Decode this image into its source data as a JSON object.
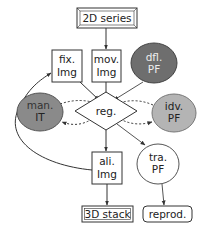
{
  "nodes": {
    "series2d": {
      "label": "2D series",
      "shape": "snip-box"
    },
    "fix_img": {
      "lines": [
        "fix.",
        "Img"
      ],
      "shape": "box"
    },
    "mov_img": {
      "lines": [
        "mov.",
        "Img"
      ],
      "shape": "box"
    },
    "dfl_pf": {
      "lines": [
        "dfl.",
        "PF"
      ],
      "shape": "ellipse",
      "fill": "#6e6e6e"
    },
    "man_it": {
      "lines": [
        "man.",
        "IT"
      ],
      "shape": "ellipse",
      "fill": "#8a8a8a"
    },
    "reg": {
      "label": "reg.",
      "shape": "diamond"
    },
    "idv_pf": {
      "lines": [
        "idv.",
        "PF"
      ],
      "shape": "ellipse",
      "fill": "#b4b4b4"
    },
    "ali_img": {
      "lines": [
        "ali.",
        "Img"
      ],
      "shape": "box"
    },
    "tra_pf": {
      "lines": [
        "tra.",
        "PF"
      ],
      "shape": "ellipse",
      "fill": "#ffffff"
    },
    "stack3d": {
      "label": "3D stack",
      "shape": "double-box"
    },
    "reprod": {
      "label": "reprod.",
      "shape": "rounded-box"
    }
  },
  "edges": [
    {
      "from": "2D series",
      "to": "mov. Img",
      "style": "solid"
    },
    {
      "from": "fix. Img",
      "to": "reg.",
      "style": "solid"
    },
    {
      "from": "mov. Img",
      "to": "reg.",
      "style": "solid"
    },
    {
      "from": "dfl. PF",
      "to": "reg.",
      "style": "solid"
    },
    {
      "from": "man. IT",
      "to": "reg.",
      "style": "dashed"
    },
    {
      "from": "reg.",
      "to": "man. IT",
      "style": "dashed"
    },
    {
      "from": "idv. PF",
      "to": "reg.",
      "style": "dashed"
    },
    {
      "from": "reg.",
      "to": "idv. PF",
      "style": "dashed"
    },
    {
      "from": "reg.",
      "to": "ali. Img",
      "style": "solid"
    },
    {
      "from": "reg.",
      "to": "tra. PF",
      "style": "solid"
    },
    {
      "from": "ali. Img",
      "to": "fix. Img",
      "style": "solid-curved"
    },
    {
      "from": "ali. Img",
      "to": "3D stack",
      "style": "solid"
    },
    {
      "from": "tra. PF",
      "to": "reprod.",
      "style": "solid"
    }
  ],
  "colors": {
    "stroke": "#333333",
    "text": "#222222"
  }
}
